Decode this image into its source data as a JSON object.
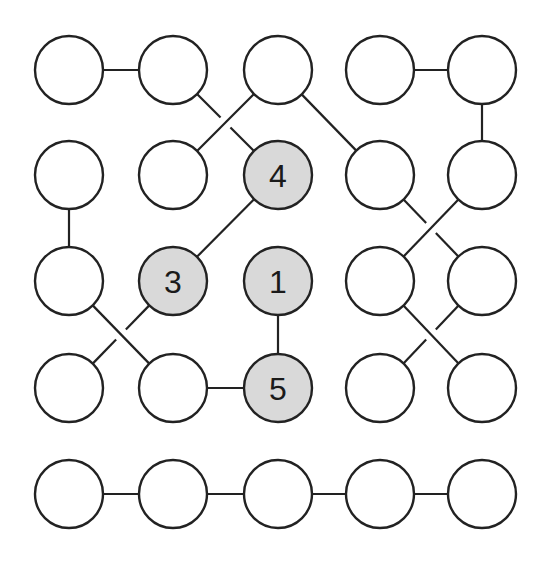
{
  "diagram": {
    "type": "grid-graph-puzzle",
    "grid": {
      "rows": 5,
      "cols": 5
    },
    "colors": {
      "stroke": "#222222",
      "empty_fill": "#ffffff",
      "numbered_fill": "#d9d9d9",
      "label": "#1a1a1a"
    },
    "col_x": [
      69,
      173,
      278,
      380,
      482
    ],
    "row_y": [
      70,
      175,
      281,
      388,
      494
    ],
    "radius": 34,
    "nodes": [
      {
        "id": "r1c1",
        "row": 1,
        "col": 1,
        "label": ""
      },
      {
        "id": "r1c2",
        "row": 1,
        "col": 2,
        "label": ""
      },
      {
        "id": "r1c3",
        "row": 1,
        "col": 3,
        "label": ""
      },
      {
        "id": "r1c4",
        "row": 1,
        "col": 4,
        "label": ""
      },
      {
        "id": "r1c5",
        "row": 1,
        "col": 5,
        "label": ""
      },
      {
        "id": "r2c1",
        "row": 2,
        "col": 1,
        "label": ""
      },
      {
        "id": "r2c2",
        "row": 2,
        "col": 2,
        "label": ""
      },
      {
        "id": "r2c3",
        "row": 2,
        "col": 3,
        "label": "4"
      },
      {
        "id": "r2c4",
        "row": 2,
        "col": 4,
        "label": ""
      },
      {
        "id": "r2c5",
        "row": 2,
        "col": 5,
        "label": ""
      },
      {
        "id": "r3c1",
        "row": 3,
        "col": 1,
        "label": ""
      },
      {
        "id": "r3c2",
        "row": 3,
        "col": 2,
        "label": "3"
      },
      {
        "id": "r3c3",
        "row": 3,
        "col": 3,
        "label": "1"
      },
      {
        "id": "r3c4",
        "row": 3,
        "col": 4,
        "label": ""
      },
      {
        "id": "r3c5",
        "row": 3,
        "col": 5,
        "label": ""
      },
      {
        "id": "r4c1",
        "row": 4,
        "col": 1,
        "label": ""
      },
      {
        "id": "r4c2",
        "row": 4,
        "col": 2,
        "label": ""
      },
      {
        "id": "r4c3",
        "row": 4,
        "col": 3,
        "label": "5"
      },
      {
        "id": "r4c4",
        "row": 4,
        "col": 4,
        "label": ""
      },
      {
        "id": "r4c5",
        "row": 4,
        "col": 5,
        "label": ""
      },
      {
        "id": "r5c1",
        "row": 5,
        "col": 1,
        "label": ""
      },
      {
        "id": "r5c2",
        "row": 5,
        "col": 2,
        "label": ""
      },
      {
        "id": "r5c3",
        "row": 5,
        "col": 3,
        "label": ""
      },
      {
        "id": "r5c4",
        "row": 5,
        "col": 4,
        "label": ""
      },
      {
        "id": "r5c5",
        "row": 5,
        "col": 5,
        "label": ""
      }
    ],
    "edges": [
      {
        "from": "r1c1",
        "to": "r1c2",
        "gap": false
      },
      {
        "from": "r1c4",
        "to": "r1c5",
        "gap": false
      },
      {
        "from": "r1c2",
        "to": "r2c3",
        "gap": true
      },
      {
        "from": "r1c3",
        "to": "r2c2",
        "gap": false
      },
      {
        "from": "r1c3",
        "to": "r2c4",
        "gap": false
      },
      {
        "from": "r1c5",
        "to": "r2c5",
        "gap": false
      },
      {
        "from": "r2c1",
        "to": "r3c1",
        "gap": false
      },
      {
        "from": "r2c3",
        "to": "r3c2",
        "gap": false
      },
      {
        "from": "r2c4",
        "to": "r3c5",
        "gap": true
      },
      {
        "from": "r2c5",
        "to": "r3c4",
        "gap": false
      },
      {
        "from": "r3c1",
        "to": "r4c2",
        "gap": false
      },
      {
        "from": "r3c2",
        "to": "r4c1",
        "gap": true
      },
      {
        "from": "r3c3",
        "to": "r4c3",
        "gap": false
      },
      {
        "from": "r4c2",
        "to": "r4c3",
        "gap": false
      },
      {
        "from": "r3c4",
        "to": "r4c5",
        "gap": false
      },
      {
        "from": "r3c5",
        "to": "r4c4",
        "gap": true
      },
      {
        "from": "r5c1",
        "to": "r5c2",
        "gap": false
      },
      {
        "from": "r5c2",
        "to": "r5c3",
        "gap": false
      },
      {
        "from": "r5c3",
        "to": "r5c4",
        "gap": false
      },
      {
        "from": "r5c4",
        "to": "r5c5",
        "gap": false
      }
    ]
  }
}
